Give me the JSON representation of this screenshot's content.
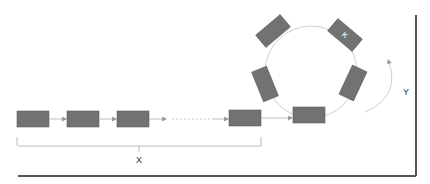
{
  "diagram": {
    "type": "linear chain feeding into ring",
    "linear_chain": {
      "block_count_visible": 4,
      "gap": "dotted continuation between third and fourth block",
      "brace_label": "X"
    },
    "ring": {
      "block_count": 6,
      "rotation_arrow_label": "Y",
      "marked_block_label": "K"
    },
    "colors": {
      "block": "#727272",
      "connector": "#bdbdbd",
      "frame": "#555555"
    }
  }
}
